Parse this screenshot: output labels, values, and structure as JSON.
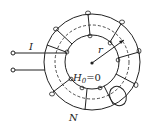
{
  "diagram": {
    "labels": {
      "current": "I",
      "radius": "r",
      "field": "H",
      "field_sub": "0",
      "field_eq": "=0",
      "turns": "N"
    },
    "colors": {
      "stroke": "#222222",
      "background": "#ffffff"
    }
  }
}
